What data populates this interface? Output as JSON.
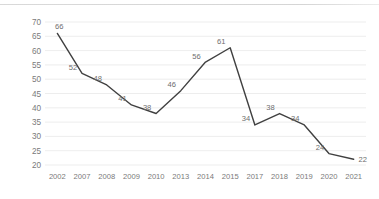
{
  "chart_data": {
    "type": "line",
    "title": "",
    "subtitle": "",
    "xlabel": "",
    "ylabel": "",
    "categories": [
      "2002",
      "2007",
      "2008",
      "2009",
      "2010",
      "2013",
      "2014",
      "2015",
      "2017",
      "2018",
      "2019",
      "2020",
      "2021"
    ],
    "values": [
      66,
      52,
      48,
      41,
      38,
      46,
      56,
      61,
      34,
      38,
      34,
      24,
      22
    ],
    "series": [
      {
        "name": "",
        "values": [
          66,
          52,
          48,
          41,
          38,
          46,
          56,
          61,
          34,
          38,
          34,
          24,
          22
        ]
      }
    ],
    "point_labels": [
      "66",
      "52",
      "48",
      "41",
      "38",
      "46",
      "56",
      "61",
      "34",
      "38",
      "34",
      "24",
      "22"
    ],
    "ylim": [
      20,
      70
    ],
    "ytick_step": 5,
    "ytick_labels": [
      "70",
      "65",
      "60",
      "55",
      "50",
      "45",
      "40",
      "35",
      "30",
      "25",
      "20"
    ],
    "ytick_values": [
      70,
      65,
      60,
      55,
      50,
      45,
      40,
      35,
      30,
      25,
      20
    ],
    "xtick_labels": [
      "2002",
      "2007",
      "2008",
      "2009",
      "2010",
      "2013",
      "2014",
      "2015",
      "2017",
      "2018",
      "2019",
      "2020",
      "2021"
    ],
    "grid": {
      "horizontal": true,
      "vertical": false
    },
    "legend": {
      "visible": false,
      "position": "none",
      "entries": []
    },
    "data_labels_visible": true,
    "markers_visible": false,
    "colors": {
      "line": "#404040",
      "gridline": "#e8e8e8",
      "tick_text": "#7a7a7a",
      "data_label_text": "#6e6e6e",
      "top_rule": "#d9d9d9",
      "background": "#ffffff"
    }
  }
}
